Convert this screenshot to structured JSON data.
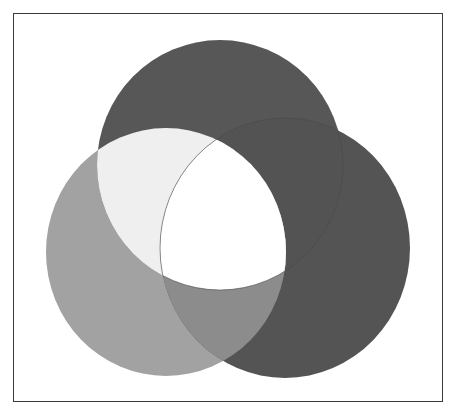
{
  "diagram": {
    "type": "three-circle-overlap",
    "frame": {
      "x": 13,
      "y": 13,
      "width": 430,
      "height": 389,
      "stroke": "#3a3a3a"
    },
    "circles": [
      {
        "id": "top",
        "cx": 220,
        "cy": 165,
        "rx": 123,
        "ry": 125,
        "fill": "#575757"
      },
      {
        "id": "left",
        "cx": 166,
        "cy": 252,
        "rx": 120,
        "ry": 124,
        "fill": "#a2a2a2"
      },
      {
        "id": "right",
        "cx": 285,
        "cy": 248,
        "rx": 125,
        "ry": 130,
        "fill": "#545454"
      }
    ],
    "overlaps": {
      "top_left": "#efefef",
      "left_right": "#8c8c8c",
      "top_right": "#535353",
      "all": "#ffffff"
    }
  }
}
